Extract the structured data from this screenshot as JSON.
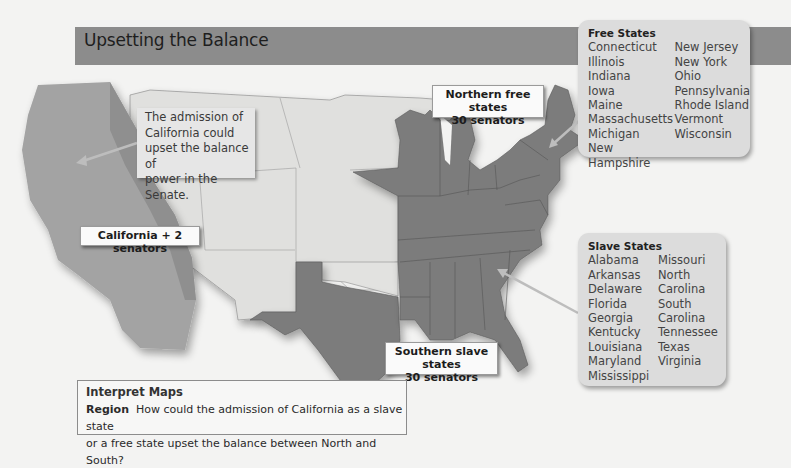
{
  "title": "Upsetting the Balance",
  "map": {
    "callout_note": [
      "The admission of",
      "California could",
      "upset the balance of",
      "power in the Senate."
    ],
    "labels": {
      "california": "California + 2 senators",
      "north_line1": "Northern free states",
      "north_line2": "30 senators",
      "south_line1": "Southern slave states",
      "south_line2": "30 senators"
    },
    "colors": {
      "title_band": "#8c8c8c",
      "california": "#a3a3a3",
      "states_dark": "#7c7c7c",
      "territories": "#e0e0de",
      "legend_bg": "#dcdcdc"
    }
  },
  "free_states": {
    "title": "Free States",
    "col1": [
      "Connecticut",
      "Illinois",
      "Indiana",
      "Iowa",
      "Maine",
      "Massachusetts",
      "Michigan",
      "New Hampshire"
    ],
    "col2": [
      "New Jersey",
      "New York",
      "Ohio",
      "Pennsylvania",
      "Rhode Island",
      "Vermont",
      "Wisconsin"
    ]
  },
  "slave_states": {
    "title": "Slave States",
    "col1": [
      "Alabama",
      "Arkansas",
      "Delaware",
      "Florida",
      "Georgia",
      "Kentucky",
      "Louisiana",
      "Maryland",
      "Mississippi"
    ],
    "col2": [
      "Missouri",
      "North",
      "Carolina",
      "South",
      "Carolina",
      "Tennessee",
      "Texas",
      "Virginia"
    ]
  },
  "interpret": {
    "heading": "Interpret Maps",
    "keyword": "Region",
    "question_line1": "How could the admission of California as a slave state",
    "question_line2": "or a free state upset the balance between North and South?"
  }
}
